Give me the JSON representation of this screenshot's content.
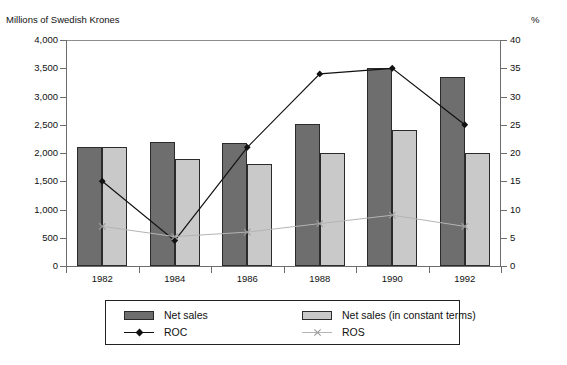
{
  "chart_data": {
    "type": "bar",
    "title": "",
    "ylabel": "Millions of Swedish Krones",
    "ylabel_right": "%",
    "xlabel": "",
    "categories": [
      "1982",
      "1984",
      "1986",
      "1988",
      "1990",
      "1992"
    ],
    "ylim": [
      0,
      4000
    ],
    "ylim_right": [
      0,
      40
    ],
    "yticks": [
      "0",
      "500",
      "1,000",
      "1,500",
      "2,000",
      "2,500",
      "3,000",
      "3,500",
      "4,000"
    ],
    "ytick_values": [
      0,
      500,
      1000,
      1500,
      2000,
      2500,
      3000,
      3500,
      4000
    ],
    "yticks_right": [
      "0",
      "5",
      "10",
      "15",
      "20",
      "25",
      "30",
      "35",
      "40"
    ],
    "ytick_values_right": [
      0,
      5,
      10,
      15,
      20,
      25,
      30,
      35,
      40
    ],
    "grid": false,
    "legend_position": "bottom",
    "series": [
      {
        "name": "Net sales",
        "kind": "bar",
        "axis": "left",
        "color": "#6e6e6e",
        "values": [
          2100,
          2200,
          2180,
          2520,
          3500,
          3350
        ]
      },
      {
        "name": "Net sales (in constant terms)",
        "kind": "bar",
        "axis": "left",
        "color": "#c9c9c9",
        "values": [
          2100,
          1900,
          1800,
          2000,
          2400,
          2000
        ]
      },
      {
        "name": "ROC",
        "kind": "line",
        "axis": "right",
        "color": "#111111",
        "marker": "diamond",
        "values": [
          15,
          4.5,
          21,
          34,
          35,
          25
        ]
      },
      {
        "name": "ROS",
        "kind": "line",
        "axis": "right",
        "color": "#b4b4b4",
        "marker": "x",
        "values": [
          7,
          5.2,
          6,
          7.5,
          9,
          7
        ]
      }
    ]
  },
  "legend": {
    "items": [
      {
        "label": "Net sales"
      },
      {
        "label": "Net sales (in constant terms)"
      },
      {
        "label": "ROC"
      },
      {
        "label": "ROS"
      }
    ]
  }
}
